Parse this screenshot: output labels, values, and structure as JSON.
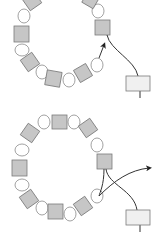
{
  "diagram": {
    "type": "beading-instructions",
    "steps": [
      {
        "id": "step-1",
        "description": "Ring of cube beads alternating with round seed beads; thread exits last cube and arrow points back into ring",
        "bead_colors": {
          "cube": "#c4c4c4",
          "round": "#ffffff",
          "stopper": "#f0f0f0",
          "outline": "#7a7a7a",
          "thread": "#333333"
        }
      },
      {
        "id": "step-2",
        "description": "Completed ring of cube beads with round beads; thread crosses and exits with arrow to the right",
        "bead_colors": {
          "cube": "#c4c4c4",
          "round": "#ffffff",
          "stopper": "#f0f0f0",
          "outline": "#7a7a7a",
          "thread": "#333333"
        }
      }
    ]
  }
}
